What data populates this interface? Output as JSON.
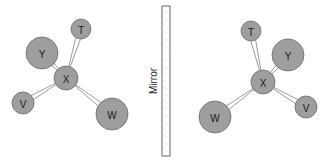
{
  "diagram": {
    "title": "",
    "mirror": {
      "label": "Mirror",
      "x": 162,
      "y": 6,
      "width": 8,
      "height": 150,
      "label_x": 153,
      "label_y": 81
    },
    "colors": {
      "atom_fill": "#9e9e9e",
      "atom_stroke": "#6a6a6a",
      "bond": "#6f6f6f",
      "background": "#ffffff"
    },
    "molecules": [
      {
        "id": "left",
        "center": "X",
        "atoms": [
          {
            "label": "X",
            "cx": 66,
            "cy": 78,
            "r": 12
          },
          {
            "label": "T",
            "cx": 81,
            "cy": 29,
            "r": 10
          },
          {
            "label": "Y",
            "cx": 42,
            "cy": 53,
            "r": 16
          },
          {
            "label": "V",
            "cx": 23,
            "cy": 103,
            "r": 11
          },
          {
            "label": "W",
            "cx": 112,
            "cy": 114,
            "r": 16
          }
        ],
        "bonds": [
          [
            "X",
            "T"
          ],
          [
            "X",
            "Y"
          ],
          [
            "X",
            "V"
          ],
          [
            "X",
            "W"
          ]
        ]
      },
      {
        "id": "right",
        "center": "X",
        "atoms": [
          {
            "label": "X",
            "cx": 263,
            "cy": 82,
            "r": 12
          },
          {
            "label": "T",
            "cx": 251,
            "cy": 31,
            "r": 10
          },
          {
            "label": "Y",
            "cx": 288,
            "cy": 55,
            "r": 16
          },
          {
            "label": "V",
            "cx": 306,
            "cy": 107,
            "r": 11
          },
          {
            "label": "W",
            "cx": 215,
            "cy": 117,
            "r": 16
          }
        ],
        "bonds": [
          [
            "X",
            "T"
          ],
          [
            "X",
            "Y"
          ],
          [
            "X",
            "V"
          ],
          [
            "X",
            "W"
          ]
        ]
      }
    ]
  }
}
